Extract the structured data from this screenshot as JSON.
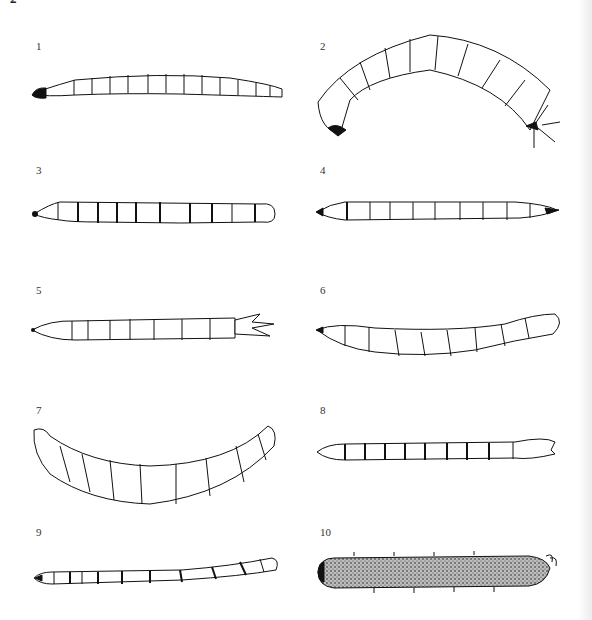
{
  "page": {
    "header_fragment": "2",
    "figure_type": "plate of line-drawn insect larvae, numbered panels"
  },
  "panels": [
    {
      "number": "1",
      "description": "slender straight larva, dark head capsule at left, many segments, tail at right"
    },
    {
      "number": "2",
      "description": "C-shaped curved larva with longitudinal dashed lines, bristles at posterior end"
    },
    {
      "number": "3",
      "description": "fusiform larva with dark intersegmental bands"
    },
    {
      "number": "4",
      "description": "fusiform larva with dark head, dashed segment markings, pointed tail"
    },
    {
      "number": "5",
      "description": "tapering larva with ventral tubercles and forked posterior processes"
    },
    {
      "number": "6",
      "description": "slightly curved larva with ventral prolegs, rounded posterior"
    },
    {
      "number": "7",
      "description": "strongly curved (U-shaped) larva with ventral tubercles"
    },
    {
      "number": "8",
      "description": "slender larva with dark banded segments, dashed lines, cleft posterior"
    },
    {
      "number": "9",
      "description": "long thin larva with banded rings, spiracular posterior"
    },
    {
      "number": "10",
      "description": "stippled (densely dotted) larva with sparse setae and hooked posterior"
    }
  ]
}
